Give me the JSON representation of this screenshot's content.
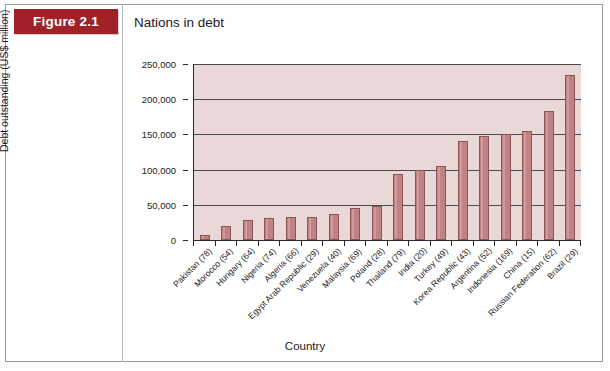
{
  "figure": {
    "badge_label": "Figure 2.1",
    "title": "Nations in debt",
    "badge_color": "#a02228"
  },
  "chart_data": {
    "type": "bar",
    "title": "Nations in debt",
    "xlabel": "Country",
    "ylabel": "Debt outstanding (US$ million)",
    "ylim": [
      0,
      250000
    ],
    "ytick_labels": [
      "250,000",
      "200,000",
      "150,000",
      "100,000",
      "50,000",
      "0"
    ],
    "ytick_values": [
      250000,
      200000,
      150000,
      100000,
      50000,
      0
    ],
    "grid": true,
    "legend": null,
    "bar_color": "#c08384",
    "plot_background": "#ead8d8",
    "categories": [
      "Pakistan (78)",
      "Morocco (54)",
      "Hungary (64)",
      "Nigeria (74)",
      "Algeria (66)",
      "Egypt Arab Republic (29)",
      "Venezuela (40)",
      "Malaysia (69)",
      "Poland (28)",
      "Thailand (79)",
      "India (20)",
      "Turkey (49)",
      "Korea Republic (43)",
      "Argentina (52)",
      "Indonesia (169)",
      "China (15)",
      "Russian Federation (62)",
      "Brazil (29)"
    ],
    "values": [
      7000,
      20000,
      28000,
      31000,
      32000,
      32000,
      37000,
      45000,
      48000,
      94000,
      100000,
      105000,
      140000,
      148000,
      151000,
      155000,
      183000,
      235000
    ]
  }
}
